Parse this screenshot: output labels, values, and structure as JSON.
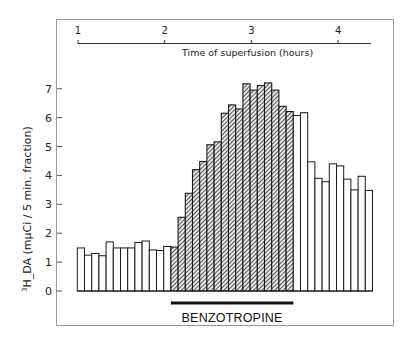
{
  "chart_data": {
    "type": "bar",
    "title": "",
    "xlabel": "Time of superfusion (hours)",
    "ylabel": "3H_DA (mµCi / 5 min. fraction)",
    "ylabel_superscript": "3",
    "ylabel_main": "H_DA (mµCi / 5 min. fraction)",
    "ylim": [
      0,
      7.5
    ],
    "yticks": [
      0,
      1,
      2,
      3,
      4,
      5,
      6,
      7
    ],
    "xaxis_position": "top",
    "xticks": [
      1,
      2,
      3,
      4
    ],
    "grid": false,
    "legend": null,
    "bar_unit": "5 min. fraction",
    "fractions": [
      1,
      2,
      3,
      4,
      5,
      6,
      7,
      8,
      9,
      10,
      11,
      12,
      13,
      14,
      15,
      16,
      17,
      18,
      19,
      20,
      21,
      22,
      23,
      24,
      25,
      26,
      27,
      28,
      29,
      30,
      31,
      32,
      33,
      34,
      35,
      36,
      37,
      38,
      39,
      40,
      41
    ],
    "values": [
      1.49,
      1.24,
      1.3,
      1.22,
      1.7,
      1.49,
      1.49,
      1.49,
      1.68,
      1.73,
      1.42,
      1.4,
      1.54,
      1.52,
      2.55,
      3.38,
      4.2,
      4.48,
      5.06,
      5.16,
      6.15,
      6.44,
      6.3,
      7.17,
      6.95,
      7.11,
      7.2,
      6.95,
      6.39,
      6.21,
      6.07,
      6.17,
      4.47,
      3.9,
      3.78,
      4.4,
      4.33,
      3.87,
      3.5,
      3.97,
      3.48
    ],
    "hatched": [
      false,
      false,
      false,
      false,
      false,
      false,
      false,
      false,
      false,
      false,
      false,
      false,
      false,
      true,
      true,
      true,
      true,
      true,
      true,
      true,
      true,
      true,
      true,
      true,
      true,
      true,
      true,
      true,
      true,
      true,
      false,
      false,
      false,
      false,
      false,
      false,
      false,
      false,
      false,
      false,
      false
    ],
    "annotations": [
      {
        "type": "treatment-bar",
        "label": "BENZOTROPINE",
        "from_fraction": 14,
        "to_fraction": 30
      }
    ]
  },
  "colors": {
    "ink": "#1a1a1a",
    "bar_fill": "#ffffff",
    "hatch_fill": "#555555",
    "frame": "#888888"
  }
}
